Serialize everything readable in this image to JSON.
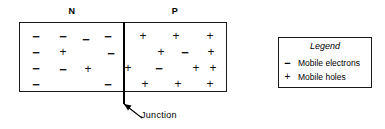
{
  "diagram": {
    "regions": [
      {
        "id": "n",
        "label": "N"
      },
      {
        "id": "p",
        "label": "P"
      }
    ],
    "junction": {
      "label": "Junction"
    },
    "carriers": {
      "n_region": [
        {
          "symbol": "−",
          "type": "minus",
          "x": 16,
          "y": 13
        },
        {
          "symbol": "−",
          "type": "minus",
          "x": 43,
          "y": 13
        },
        {
          "symbol": "−",
          "type": "minus",
          "x": 66,
          "y": 16
        },
        {
          "symbol": "−",
          "type": "minus",
          "x": 88,
          "y": 13
        },
        {
          "symbol": "−",
          "type": "minus",
          "x": 16,
          "y": 29
        },
        {
          "symbol": "+",
          "type": "plus",
          "x": 43,
          "y": 29
        },
        {
          "symbol": "−",
          "type": "minus",
          "x": 91,
          "y": 30
        },
        {
          "symbol": "−",
          "type": "minus",
          "x": 16,
          "y": 45
        },
        {
          "symbol": "−",
          "type": "minus",
          "x": 43,
          "y": 46
        },
        {
          "symbol": "+",
          "type": "plus",
          "x": 68,
          "y": 46
        },
        {
          "symbol": "−",
          "type": "minus",
          "x": 16,
          "y": 61
        },
        {
          "symbol": "−",
          "type": "minus",
          "x": 88,
          "y": 61
        }
      ],
      "p_region": [
        {
          "symbol": "+",
          "type": "plus",
          "x": 18,
          "y": 13
        },
        {
          "symbol": "+",
          "type": "plus",
          "x": 51,
          "y": 13
        },
        {
          "symbol": "+",
          "type": "plus",
          "x": 85,
          "y": 13
        },
        {
          "symbol": "+",
          "type": "plus",
          "x": 36,
          "y": 29
        },
        {
          "symbol": "−",
          "type": "minus",
          "x": 60,
          "y": 29
        },
        {
          "symbol": "+",
          "type": "plus",
          "x": 86,
          "y": 29
        },
        {
          "symbol": "+",
          "type": "plus",
          "x": 3,
          "y": 45
        },
        {
          "symbol": "−",
          "type": "minus",
          "x": 34,
          "y": 45
        },
        {
          "symbol": "+",
          "type": "plus",
          "x": 71,
          "y": 45
        },
        {
          "symbol": "+",
          "type": "plus",
          "x": 88,
          "y": 45
        },
        {
          "symbol": "+",
          "type": "plus",
          "x": 20,
          "y": 61
        },
        {
          "symbol": "+",
          "type": "plus",
          "x": 53,
          "y": 61
        },
        {
          "symbol": "+",
          "type": "plus",
          "x": 85,
          "y": 61
        }
      ]
    }
  },
  "legend": {
    "title": "Legend",
    "entries": [
      {
        "symbol": "−",
        "type": "minus",
        "text": "Mobile electrons"
      },
      {
        "symbol": "+",
        "type": "plus",
        "text": "Mobile holes"
      }
    ]
  },
  "colors": {
    "stroke": "#1a1a1a",
    "text": "#000000",
    "background": "#ffffff"
  }
}
